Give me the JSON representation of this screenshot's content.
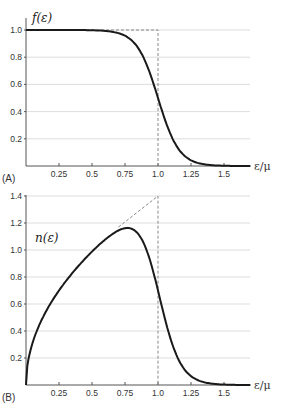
{
  "chart_data": [
    {
      "panel": "(A)",
      "type": "line",
      "title": "",
      "ylabel": "f(ε)",
      "xlabel": "ε/μ",
      "xlim": [
        0,
        1.7
      ],
      "ylim": [
        0,
        1.05
      ],
      "xticks": [
        0.25,
        0.5,
        0.75,
        1.0,
        1.25,
        1.5
      ],
      "xtick_labels": [
        "0.25",
        "0.5",
        "0.75",
        "1.0",
        "1.25",
        "1.5"
      ],
      "yticks": [
        0.2,
        0.4,
        0.6,
        0.8,
        1.0
      ],
      "ytick_labels": [
        "0.2",
        "0.4",
        "0.6",
        "0.8",
        "1.0"
      ],
      "grid": "horizontal",
      "series": [
        {
          "name": "f(ε) finite temperature",
          "style": "solid",
          "x": [
            0,
            0.25,
            0.5,
            0.6,
            0.7,
            0.8,
            0.9,
            1.0,
            1.1,
            1.2,
            1.3,
            1.4,
            1.5,
            1.6,
            1.7
          ],
          "y": [
            1.0,
            1.0,
            1.0,
            0.99,
            0.98,
            0.92,
            0.78,
            0.5,
            0.22,
            0.08,
            0.02,
            0.007,
            0.002,
            0.0,
            0.0
          ]
        },
        {
          "name": "f(ε) zero temperature (step)",
          "style": "dashed",
          "x": [
            0,
            1.0,
            1.0
          ],
          "y": [
            1.0,
            1.0,
            0.0
          ]
        }
      ]
    },
    {
      "panel": "(B)",
      "type": "line",
      "title": "",
      "ylabel": "n(ε)",
      "xlabel": "ε/μ",
      "xlim": [
        0,
        1.7
      ],
      "ylim": [
        0,
        1.4
      ],
      "xticks": [
        0.25,
        0.5,
        0.75,
        1.0,
        1.25,
        1.5
      ],
      "xtick_labels": [
        "0.25",
        "0.5",
        "0.75",
        "1.0",
        "1.25",
        "1.5"
      ],
      "yticks": [
        0.2,
        0.4,
        0.6,
        0.8,
        1.0,
        1.2,
        1.4
      ],
      "ytick_labels": [
        "0.2",
        "0.4",
        "0.6",
        "0.8",
        "1.0",
        "1.2",
        "1.4"
      ],
      "grid": "horizontal",
      "series": [
        {
          "name": "n(ε) finite temperature",
          "style": "solid",
          "x": [
            0,
            0.05,
            0.1,
            0.25,
            0.5,
            0.6,
            0.7,
            0.75,
            0.8,
            0.9,
            1.0,
            1.1,
            1.2,
            1.3,
            1.4,
            1.5,
            1.6,
            1.7
          ],
          "y": [
            0,
            0.31,
            0.44,
            0.7,
            0.99,
            1.07,
            1.15,
            1.19,
            1.15,
            1.04,
            0.7,
            0.32,
            0.12,
            0.04,
            0.01,
            0.003,
            0.0,
            0.0
          ]
        },
        {
          "name": "n(ε) zero temperature",
          "style": "dashed",
          "x": [
            0.7,
            1.0,
            1.0
          ],
          "y": [
            1.17,
            1.4,
            0.0
          ]
        }
      ]
    }
  ],
  "labels": {
    "panel_a": "(A)",
    "panel_b": "(B)",
    "ylabel_a": "f(ε)",
    "ylabel_b": "n(ε)",
    "xlabel": "ε/μ"
  }
}
